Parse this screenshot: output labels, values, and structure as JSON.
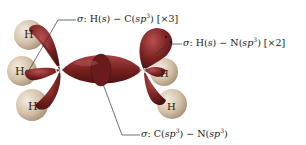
{
  "figure": {
    "atoms": {
      "carbon": "C",
      "nitrogen": "N",
      "hydrogen": "H"
    },
    "labels": {
      "ch": {
        "sigma": "σ",
        "text_prefix": ": H(",
        "s": "s",
        "mid": ") − C(",
        "sp": "sp",
        "exp": "3",
        "suffix": ") [×3]"
      },
      "nh": {
        "sigma": "σ",
        "text_prefix": ": H(",
        "s": "s",
        "mid": ") − N(",
        "sp": "sp",
        "exp": "3",
        "suffix": ") [×2]"
      },
      "cn": {
        "sigma": "σ",
        "text_prefix": ": C(",
        "sp1": "sp",
        "exp1": "3",
        "mid": ") − N(",
        "sp2": "sp",
        "exp2": "3",
        "suffix": ")"
      }
    },
    "colors": {
      "lobe": "#7a1f1f",
      "lobe_highlight": "#b04848",
      "hydrogen": "#d9c7b0",
      "hydrogen_highlight": "#efe3d3",
      "leader_line": "#333333"
    }
  }
}
